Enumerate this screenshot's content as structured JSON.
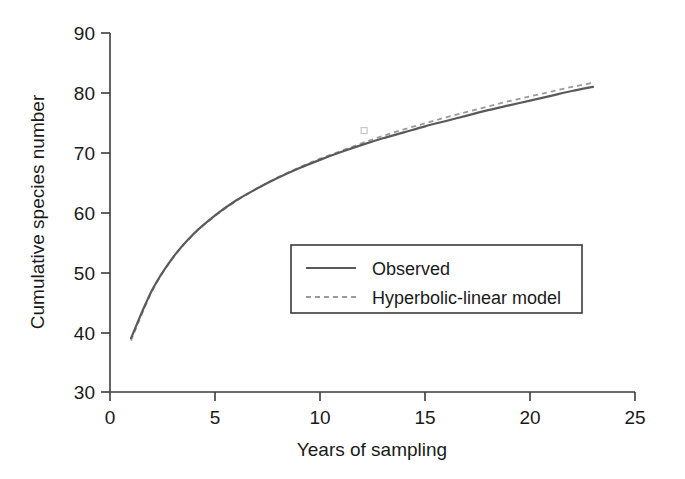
{
  "chart_data": {
    "type": "line",
    "title": "",
    "xlabel": "Years of sampling",
    "ylabel": "Cumulative species number",
    "xlim": [
      0,
      25
    ],
    "ylim": [
      30,
      90
    ],
    "xticks": [
      0,
      5,
      10,
      15,
      20,
      25
    ],
    "yticks": [
      30,
      40,
      50,
      60,
      70,
      80,
      90
    ],
    "xtick_labels": [
      "0",
      "5",
      "10",
      "15",
      "20",
      "25"
    ],
    "ytick_labels": [
      "30",
      "40",
      "50",
      "60",
      "70",
      "80",
      "90"
    ],
    "grid": false,
    "legend_position": "center-right",
    "x": [
      1,
      2,
      3,
      4,
      5,
      6,
      7,
      8,
      9,
      10,
      11,
      12,
      13,
      14,
      15,
      16,
      17,
      18,
      19,
      20,
      21,
      22,
      23
    ],
    "series": [
      {
        "name": "Observed",
        "style": "solid",
        "color": "#5a5a5a",
        "values": [
          39.0,
          47.0,
          52.5,
          56.5,
          59.5,
          62.0,
          64.0,
          65.8,
          67.4,
          68.8,
          70.1,
          71.3,
          72.4,
          73.4,
          74.4,
          75.3,
          76.2,
          77.1,
          77.9,
          78.7,
          79.5,
          80.3,
          81.0
        ]
      },
      {
        "name": "Hyperbolic-linear model",
        "style": "dashed",
        "color": "#9a9a9a",
        "values": [
          38.6,
          46.8,
          52.4,
          56.4,
          59.4,
          61.9,
          64.0,
          65.9,
          67.5,
          69.0,
          70.3,
          71.6,
          72.8,
          73.9,
          74.9,
          75.9,
          76.8,
          77.7,
          78.6,
          79.4,
          80.2,
          81.0,
          81.7
        ]
      }
    ],
    "annotations": [
      {
        "name": "faint-data-marker",
        "x": 12.1,
        "y": 73.7
      }
    ]
  },
  "legend": {
    "items": [
      {
        "label": "Observed",
        "style": "solid"
      },
      {
        "label": "Hyperbolic-linear model",
        "style": "dashed"
      }
    ]
  },
  "colors": {
    "background": "#ffffff",
    "axis": "#3b3b3b",
    "observed": "#5a5a5a",
    "model": "#9a9a9a",
    "text": "#1a1a1a"
  }
}
